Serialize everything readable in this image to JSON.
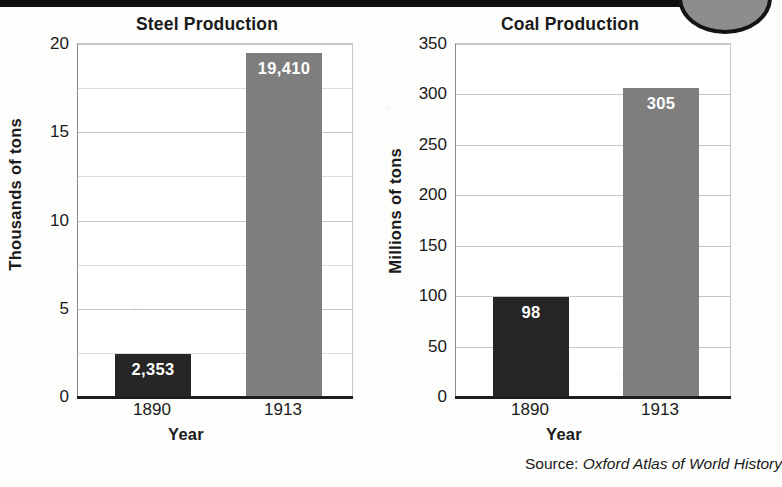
{
  "page": {
    "source_prefix": "Source:",
    "source_title": "Oxford Atlas of World History",
    "colors": {
      "bar_1890": "#262626",
      "bar_1913": "#7e7e7e",
      "gridline": "#c6c6c6",
      "axis": "#1d1d1d",
      "background": "#fdfdfc"
    }
  },
  "chart_data": [
    {
      "id": "steel",
      "type": "bar",
      "title": "Steel Production",
      "xlabel": "Year",
      "ylabel": "Thousands of tons",
      "categories": [
        "1890",
        "1913"
      ],
      "values": [
        2.353,
        19.41
      ],
      "value_labels": [
        "2,353",
        "19,410"
      ],
      "bar_colors": [
        "#262626",
        "#7e7e7e"
      ],
      "ylim": [
        0,
        20
      ],
      "ytick_labels": [
        "0",
        "5",
        "10",
        "15",
        "20"
      ],
      "ytick_values": [
        0,
        5,
        10,
        15,
        20
      ],
      "gridline_values": [
        2.5,
        5,
        7.5,
        10,
        12.5,
        15,
        17.5,
        20
      ],
      "grid": true,
      "legend": "none",
      "units": "thousands of tons"
    },
    {
      "id": "coal",
      "type": "bar",
      "title": "Coal Production",
      "xlabel": "Year",
      "ylabel": "Millions of tons",
      "categories": [
        "1890",
        "1913"
      ],
      "values": [
        98,
        305
      ],
      "value_labels": [
        "98",
        "305"
      ],
      "bar_colors": [
        "#262626",
        "#7e7e7e"
      ],
      "ylim": [
        0,
        350
      ],
      "ytick_labels": [
        "0",
        "50",
        "100",
        "150",
        "200",
        "250",
        "300",
        "350"
      ],
      "ytick_values": [
        0,
        50,
        100,
        150,
        200,
        250,
        300,
        350
      ],
      "gridline_values": [
        50,
        100,
        150,
        200,
        250,
        300,
        350
      ],
      "grid": true,
      "legend": "none",
      "units": "millions of tons"
    }
  ]
}
